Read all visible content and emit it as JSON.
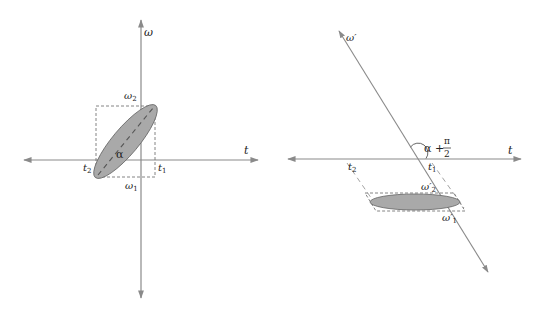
{
  "colors": {
    "axis": "#8a8a8a",
    "dash": "#777777",
    "ellipse_fill": "#a9a9a9",
    "ellipse_stroke": "#666666",
    "text": "#222222"
  },
  "left_panel": {
    "axis_labels": {
      "x": "t",
      "y": "ω"
    },
    "box_labels": {
      "t1": "t",
      "t1_sub": "1",
      "t2": "t",
      "t2_sub": "2",
      "w1": "ω",
      "w1_sub": "1",
      "w2": "ω",
      "w2_sub": "2"
    },
    "angle_label": "α"
  },
  "right_panel": {
    "axis_labels": {
      "x": "t",
      "y": "ω′"
    },
    "box_labels": {
      "t1": "t",
      "t1_sub": "1",
      "t2": "t",
      "t2_sub": "2",
      "w1": "ω′",
      "w1_sub": "1",
      "w2": "ω′",
      "w2_sub": "2"
    },
    "angle_label": "α +",
    "angle_frac_num": "π",
    "angle_frac_den": "2"
  }
}
